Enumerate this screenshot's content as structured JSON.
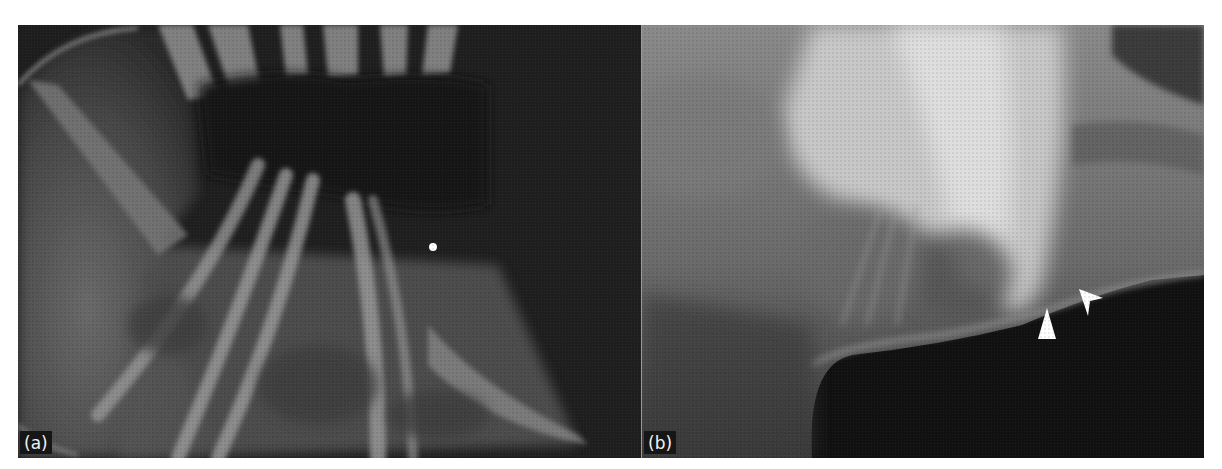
{
  "figure": {
    "panels": [
      {
        "id": "a",
        "label": "(a)",
        "content": "radiograph-thorax-ribs",
        "markers": [
          {
            "type": "dot",
            "color": "#ffffff",
            "x": 415,
            "y": 222
          }
        ]
      },
      {
        "id": "b",
        "label": "(b)",
        "content": "radiograph-lateral-view",
        "markers": [
          {
            "type": "arrowhead",
            "color": "#ffffff",
            "x": 405,
            "y": 318,
            "direction": "up"
          },
          {
            "type": "arrowhead",
            "color": "#ffffff",
            "x": 450,
            "y": 298,
            "direction": "up-left"
          }
        ]
      }
    ]
  }
}
